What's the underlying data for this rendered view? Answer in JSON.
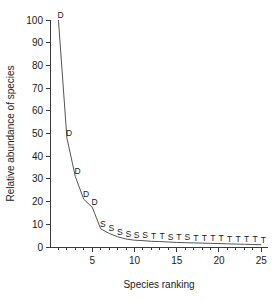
{
  "chart_data": {
    "type": "line",
    "title": "",
    "xlabel": "Species ranking",
    "ylabel": "Relative abundance of species",
    "xlim": [
      0,
      25.8
    ],
    "ylim": [
      0,
      100
    ],
    "grid": false,
    "legend": "none",
    "x_ticks": [
      5,
      10,
      15,
      20,
      25
    ],
    "x_tick_labels": [
      "5",
      "10",
      "15",
      "20",
      "25"
    ],
    "x_minor_ticks": [
      1,
      2,
      3,
      4,
      6,
      7,
      8,
      9,
      11,
      12,
      13,
      14,
      16,
      17,
      18,
      19,
      21,
      22,
      23,
      24
    ],
    "y_ticks": [
      0,
      10,
      20,
      30,
      40,
      50,
      60,
      70,
      80,
      90,
      100
    ],
    "y_tick_labels": [
      "0",
      "10",
      "20",
      "30",
      "40",
      "50",
      "60",
      "70",
      "80",
      "90",
      "100"
    ],
    "x": [
      1,
      2,
      3,
      4,
      5,
      6,
      7,
      8,
      9,
      10,
      11,
      12,
      13,
      14,
      15,
      16,
      17,
      18,
      19,
      20,
      21,
      22,
      23,
      24,
      25
    ],
    "values": [
      100,
      48,
      31,
      21,
      17.5,
      8,
      6,
      4.5,
      3.5,
      3,
      2.8,
      2.5,
      2.4,
      2.2,
      2,
      1.9,
      1.8,
      1.7,
      1.6,
      1.5,
      1.4,
      1.3,
      1.2,
      1.1,
      1
    ],
    "point_labels": [
      "D",
      "D",
      "D",
      "D",
      "D",
      "S",
      "S",
      "S",
      "S",
      "S",
      "S",
      "T",
      "T",
      "S",
      "T",
      "S",
      "T",
      "T",
      "T",
      "T",
      "T",
      "T",
      "T",
      "T",
      "T"
    ],
    "line_color": "#555555",
    "axis_color": "#3a3a3a",
    "text_color": "#1a1a1a"
  }
}
